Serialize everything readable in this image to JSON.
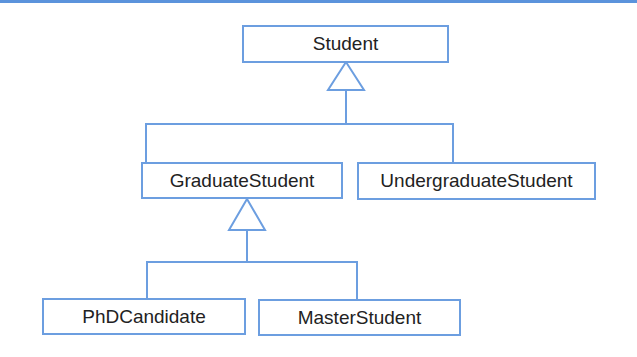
{
  "diagram": {
    "type": "uml-class-inheritance",
    "colors": {
      "line": "#6c9ee0",
      "rule": "#5b93dc",
      "text": "#222222",
      "background": "#ffffff"
    },
    "classes": {
      "student": "Student",
      "graduate": "GraduateStudent",
      "undergraduate": "UndergraduateStudent",
      "phd": "PhDCandidate",
      "master": "MasterStudent"
    },
    "relations": [
      {
        "parent": "Student",
        "children": [
          "GraduateStudent",
          "UndergraduateStudent"
        ],
        "kind": "generalization"
      },
      {
        "parent": "GraduateStudent",
        "children": [
          "PhDCandidate",
          "MasterStudent"
        ],
        "kind": "generalization"
      }
    ]
  }
}
